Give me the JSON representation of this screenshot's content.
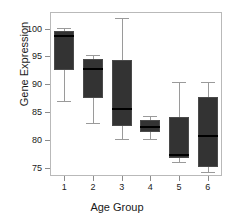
{
  "chart_data": {
    "type": "box",
    "title": "",
    "xlabel": "Age Group",
    "ylabel": "Gene Expression",
    "categories": [
      "1",
      "2",
      "3",
      "4",
      "5",
      "6"
    ],
    "ylim": [
      73.5,
      103.0
    ],
    "yticks": [
      75,
      80,
      85,
      90,
      95,
      100
    ],
    "ytick_labels": [
      "75",
      "80",
      "85",
      "90",
      "95",
      "100"
    ],
    "grid": false,
    "legend": "none",
    "box_fill_color": "#333333",
    "median_color": "#000000",
    "whisker_color": "#9a9a9a",
    "axis_color": "#b9b9b9",
    "boxes": [
      {
        "category": "1",
        "whisker_low": 87.0,
        "q1": 92.6,
        "median": 98.6,
        "q3": 99.6,
        "whisker_high": 100.2
      },
      {
        "category": "2",
        "whisker_low": 83.0,
        "q1": 87.5,
        "median": 92.8,
        "q3": 94.5,
        "whisker_high": 95.3
      },
      {
        "category": "3",
        "whisker_low": 80.1,
        "q1": 82.5,
        "median": 85.6,
        "q3": 94.3,
        "whisker_high": 102.0
      },
      {
        "category": "4",
        "whisker_low": 80.1,
        "q1": 81.4,
        "median": 82.3,
        "q3": 83.5,
        "whisker_high": 84.3
      },
      {
        "category": "5",
        "whisker_low": 76.1,
        "q1": 76.7,
        "median": 77.3,
        "q3": 84.2,
        "whisker_high": 90.4
      },
      {
        "category": "6",
        "whisker_low": 74.3,
        "q1": 75.2,
        "median": 80.7,
        "q3": 87.8,
        "whisker_high": 90.4
      }
    ]
  }
}
